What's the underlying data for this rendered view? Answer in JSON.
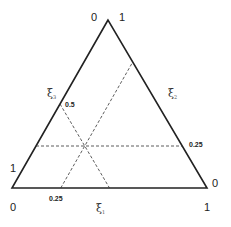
{
  "diagram": {
    "type": "ternary-coordinate-triangle",
    "vertex_labels": {
      "top_left": "0",
      "top_right": "1",
      "left": "1",
      "right": "0",
      "bottom_left": "0",
      "bottom_right": "1"
    },
    "axes": [
      {
        "symbol": "ξ",
        "subscript": "1",
        "side": "bottom"
      },
      {
        "symbol": "ξ",
        "subscript": "2",
        "side": "right"
      },
      {
        "symbol": "ξ",
        "subscript": "3",
        "side": "left"
      }
    ],
    "reference_lines": [
      {
        "axis": "ξ1",
        "value": 0.25,
        "label": "0.25"
      },
      {
        "axis": "ξ2",
        "value": 0.25,
        "label": "0.25"
      },
      {
        "axis": "ξ3",
        "value": 0.5,
        "label": "0.5"
      }
    ],
    "line_color": "#222222",
    "dash_color": "#333333"
  }
}
